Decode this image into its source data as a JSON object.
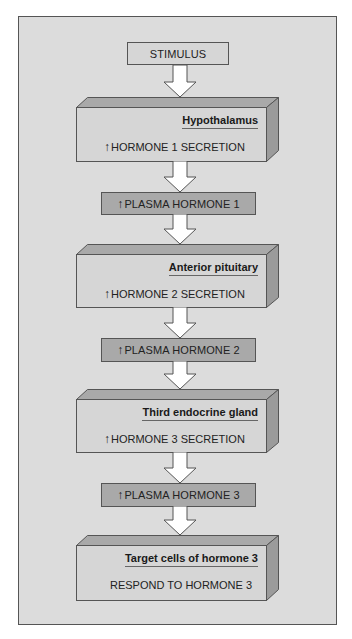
{
  "diagram": {
    "type": "flowchart",
    "colors": {
      "panel": "#dcdcdc",
      "box_front": "#d6d6d6",
      "box_top": "#a9a9a9",
      "box_side": "#9b9b9b",
      "plasma_box": "#a9a9a9",
      "arrow_fill": "#ffffff",
      "outline": "#555555"
    },
    "up_arrow_symbol": "↑",
    "stimulus": {
      "label": "STIMULUS"
    },
    "blocks": [
      {
        "title": "Hypothalamus",
        "text": "HORMONE 1 SECRETION",
        "has_up_arrow": true
      },
      {
        "title": "Anterior pituitary",
        "text": "HORMONE 2 SECRETION",
        "has_up_arrow": true
      },
      {
        "title": "Third endocrine gland",
        "text": "HORMONE 3 SECRETION",
        "has_up_arrow": true
      },
      {
        "title": "Target cells of hormone 3",
        "text": "RESPOND TO HORMONE 3",
        "has_up_arrow": false
      }
    ],
    "plasma": [
      {
        "label": "PLASMA HORMONE 1",
        "has_up_arrow": true
      },
      {
        "label": "PLASMA HORMONE 2",
        "has_up_arrow": true
      },
      {
        "label": "PLASMA HORMONE 3",
        "has_up_arrow": true
      }
    ]
  }
}
